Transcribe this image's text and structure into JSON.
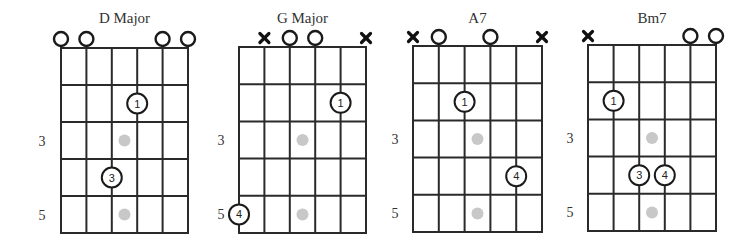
{
  "diagram": {
    "strings": 6,
    "frets_shown": 5,
    "inlay_frets": [
      3,
      5
    ],
    "inlay_color": "#c8c8c8",
    "line_color": "#2a2a2a",
    "chords": [
      {
        "name": "D Major",
        "fret_labels": [
          {
            "fret": 3,
            "text": "3"
          },
          {
            "fret": 5,
            "text": "5"
          }
        ],
        "open_strings": [
          1,
          2,
          5,
          6
        ],
        "muted_strings": [],
        "fingers": [
          {
            "string": 4,
            "fret": 2,
            "finger": "1"
          },
          {
            "string": 3,
            "fret": 4,
            "finger": "3"
          }
        ]
      },
      {
        "name": "G Major",
        "fret_labels": [
          {
            "fret": 3,
            "text": "3"
          },
          {
            "fret": 5,
            "text": "5"
          }
        ],
        "open_strings": [
          3,
          4
        ],
        "muted_strings": [
          2,
          6
        ],
        "fingers": [
          {
            "string": 5,
            "fret": 2,
            "finger": "1"
          },
          {
            "string": 1,
            "fret": 5,
            "finger": "4"
          }
        ]
      },
      {
        "name": "A7",
        "fret_labels": [
          {
            "fret": 3,
            "text": "3"
          },
          {
            "fret": 5,
            "text": "5"
          }
        ],
        "open_strings": [
          2,
          4
        ],
        "muted_strings": [
          1,
          6
        ],
        "fingers": [
          {
            "string": 3,
            "fret": 2,
            "finger": "1"
          },
          {
            "string": 5,
            "fret": 4,
            "finger": "4"
          }
        ]
      },
      {
        "name": "Bm7",
        "fret_labels": [
          {
            "fret": 3,
            "text": "3"
          },
          {
            "fret": 5,
            "text": "5"
          }
        ],
        "open_strings": [
          5,
          6
        ],
        "muted_strings": [
          1
        ],
        "fingers": [
          {
            "string": 2,
            "fret": 2,
            "finger": "1"
          },
          {
            "string": 3,
            "fret": 4,
            "finger": "3"
          },
          {
            "string": 4,
            "fret": 4,
            "finger": "4"
          }
        ]
      }
    ]
  }
}
